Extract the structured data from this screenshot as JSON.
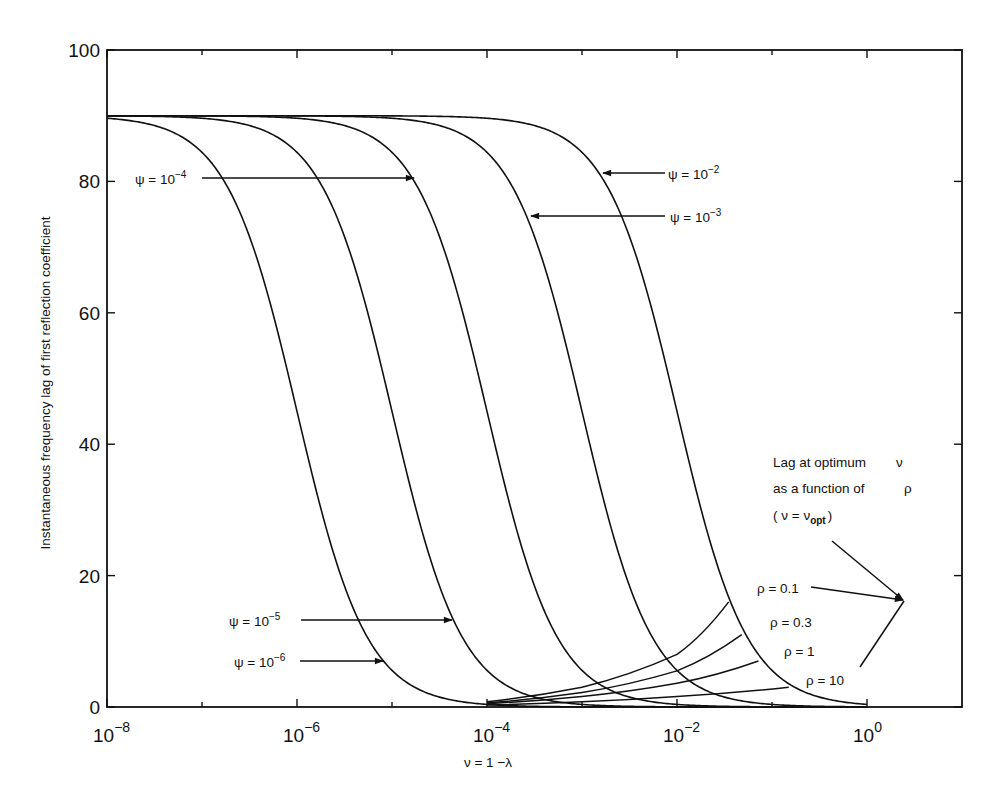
{
  "chart_data": {
    "type": "line",
    "title": "",
    "xlabel": "ν = 1 −λ",
    "ylabel": "Instantaneous frequency lag of first reflection coefficient",
    "xscale": "log",
    "xlim": [
      1e-08,
      10
    ],
    "ylim": [
      0,
      100
    ],
    "grid": false,
    "legend": "none (inline arrow annotations)",
    "x_ticks": [
      {
        "value": 1e-08,
        "base": "10",
        "exp": "−8"
      },
      {
        "value": 1e-06,
        "base": "10",
        "exp": "−6"
      },
      {
        "value": 0.0001,
        "base": "10",
        "exp": "−4"
      },
      {
        "value": 0.01,
        "base": "10",
        "exp": "−2"
      },
      {
        "value": 1,
        "base": "10",
        "exp": "0"
      }
    ],
    "x_minor_ticks": [
      1e-07,
      1e-05,
      0.001,
      0.1
    ],
    "y_ticks": [
      0,
      20,
      40,
      60,
      80,
      100
    ],
    "series": [
      {
        "name": "ψ = 10^-6",
        "psi": 1e-06,
        "x": [
          1e-08,
          1e-07,
          1e-06,
          1e-05,
          0.0001,
          0.001
        ],
        "y": [
          89.6,
          86.5,
          45,
          6.1,
          0.4,
          0.03
        ]
      },
      {
        "name": "ψ = 10^-5",
        "psi": 1e-05,
        "x": [
          1e-08,
          1e-06,
          1e-05,
          0.0001,
          0.001,
          0.01
        ],
        "y": [
          89.9,
          86.5,
          45,
          6.1,
          0.4,
          0.03
        ]
      },
      {
        "name": "ψ = 10^-4",
        "psi": 0.0001,
        "x": [
          1e-08,
          1e-05,
          0.0001,
          0.001,
          0.01,
          0.1
        ],
        "y": [
          90,
          86.5,
          45,
          6.1,
          0.4,
          0.03
        ]
      },
      {
        "name": "ψ = 10^-3",
        "psi": 0.001,
        "x": [
          1e-08,
          0.0001,
          0.001,
          0.01,
          0.1,
          1
        ],
        "y": [
          90,
          86.5,
          45,
          6.1,
          0.4,
          0.03
        ]
      },
      {
        "name": "ψ = 10^-2",
        "psi": 0.01,
        "x": [
          1e-08,
          0.001,
          0.01,
          0.1,
          1
        ],
        "y": [
          90,
          86.5,
          45,
          6.1,
          0.4
        ]
      }
    ],
    "curve_model": {
      "plateau": 90,
      "exponent": 1.18
    },
    "rho_series": [
      {
        "name": "ρ = 0.1",
        "rho": 0.1,
        "x": [
          0.0001,
          0.001,
          0.01,
          0.035
        ],
        "y": [
          0.8,
          3,
          8,
          16
        ]
      },
      {
        "name": "ρ = 0.3",
        "rho": 0.3,
        "x": [
          0.0001,
          0.001,
          0.01,
          0.048
        ],
        "y": [
          0.6,
          2.2,
          5.5,
          11
        ]
      },
      {
        "name": "ρ = 1",
        "rho": 1,
        "x": [
          0.0001,
          0.001,
          0.01,
          0.072
        ],
        "y": [
          0.5,
          1.6,
          3.6,
          7
        ]
      },
      {
        "name": "ρ = 10",
        "rho": 10,
        "x": [
          0.0001,
          0.001,
          0.01,
          0.15
        ],
        "y": [
          0.3,
          0.8,
          1.6,
          3
        ]
      }
    ],
    "annotations": {
      "psi_labels": [
        {
          "id": "psi-4",
          "base": "ψ = 10",
          "exp": "−4",
          "text_x": 135,
          "text_y": 184,
          "arrow_from": [
            202,
            178
          ],
          "arrow_to": [
            414,
            178
          ]
        },
        {
          "id": "psi-2",
          "base": "ψ = 10",
          "exp": "−2",
          "text_x": 668,
          "text_y": 179,
          "arrow_from": [
            665,
            173
          ],
          "arrow_to": [
            603,
            173
          ]
        },
        {
          "id": "psi-3",
          "base": "ψ = 10",
          "exp": "−3",
          "text_x": 670,
          "text_y": 222,
          "arrow_from": [
            665,
            216
          ],
          "arrow_to": [
            531,
            216
          ]
        },
        {
          "id": "psi-5",
          "base": "ψ = 10",
          "exp": "−5",
          "text_x": 229,
          "text_y": 626,
          "arrow_from": [
            301,
            620
          ],
          "arrow_to": [
            452,
            620
          ]
        },
        {
          "id": "psi-6",
          "base": "ψ = 10",
          "exp": "−6",
          "text_x": 234,
          "text_y": 667,
          "arrow_from": [
            300,
            661
          ],
          "arrow_to": [
            383,
            661
          ]
        }
      ],
      "rho_labels": [
        {
          "text": "ρ = 0.1",
          "x": 757,
          "y": 593
        },
        {
          "text": "ρ = 0.3",
          "x": 770,
          "y": 627
        },
        {
          "text": "ρ = 1",
          "x": 784,
          "y": 656
        },
        {
          "text": "ρ = 10",
          "x": 806,
          "y": 685
        }
      ],
      "optimum_note": {
        "line1": "Lag at optimum",
        "line1_sym": "ν",
        "line2": "as a function of",
        "line2_sym": "ρ",
        "line3_open": "( ν = ν",
        "line3_sub": "opt",
        "line3_close": ")"
      }
    }
  }
}
